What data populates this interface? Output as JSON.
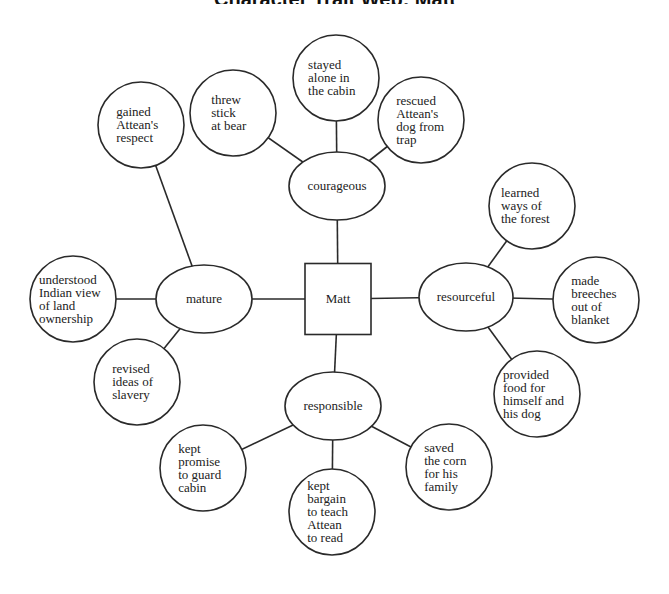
{
  "title": "Character Trait Web: Matt",
  "center": {
    "label": "Matt",
    "x": 338,
    "y": 299,
    "w": 66,
    "h": 71
  },
  "traits": [
    {
      "label": "courageous",
      "x": 337,
      "y": 186,
      "rx": 48,
      "ry": 34,
      "examples": [
        {
          "lines": [
            "threw",
            "stick",
            "at bear"
          ],
          "x": 233,
          "y": 113
        },
        {
          "lines": [
            "stayed",
            "alone in",
            "the cabin"
          ],
          "x": 336,
          "y": 78
        },
        {
          "lines": [
            "rescued",
            "Attean's",
            "dog from",
            "trap"
          ],
          "x": 421,
          "y": 120
        }
      ]
    },
    {
      "label": "mature",
      "x": 204,
      "y": 299,
      "rx": 48,
      "ry": 34,
      "examples": [
        {
          "lines": [
            "gained",
            "Attean's",
            "respect"
          ],
          "x": 141,
          "y": 125
        },
        {
          "lines": [
            "understood",
            "Indian view",
            "of land",
            "ownership"
          ],
          "x": 73,
          "y": 299
        },
        {
          "lines": [
            "revised",
            "ideas of",
            "slavery"
          ],
          "x": 137,
          "y": 382
        }
      ]
    },
    {
      "label": "resourceful",
      "x": 466,
      "y": 297,
      "rx": 47,
      "ry": 34,
      "examples": [
        {
          "lines": [
            "learned",
            "ways of",
            "the forest"
          ],
          "x": 532,
          "y": 206
        },
        {
          "lines": [
            "made",
            "breeches",
            "out of",
            "blanket"
          ],
          "x": 596,
          "y": 300
        },
        {
          "lines": [
            "provided",
            "food for",
            "himself and",
            "his dog"
          ],
          "x": 537,
          "y": 394
        }
      ]
    },
    {
      "label": "responsible",
      "x": 333,
      "y": 406,
      "rx": 48,
      "ry": 34,
      "examples": [
        {
          "lines": [
            "kept",
            "promise",
            "to guard",
            "cabin"
          ],
          "x": 203,
          "y": 468
        },
        {
          "lines": [
            "kept",
            "bargain",
            "to teach",
            "Attean",
            "to read"
          ],
          "x": 332,
          "y": 512
        },
        {
          "lines": [
            "saved",
            "the corn",
            "for his",
            "family"
          ],
          "x": 449,
          "y": 467
        }
      ]
    }
  ],
  "example_radius": 43,
  "colors": {
    "stroke": "#2a2a2a",
    "fill": "#ffffff",
    "text": "#222222"
  }
}
